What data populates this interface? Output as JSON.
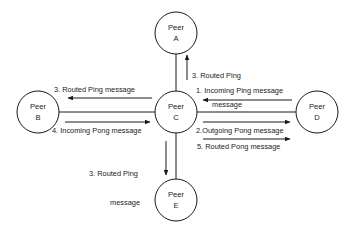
{
  "diagram": {
    "background_color": "#ffffff",
    "stroke_color": "#1a1a1a",
    "nodes": [
      {
        "id": "A",
        "line1": "Peer",
        "line2": "A",
        "cx": 176,
        "cy": 33,
        "r": 21
      },
      {
        "id": "B",
        "line1": "Peer",
        "line2": "B",
        "cx": 38,
        "cy": 112,
        "r": 21
      },
      {
        "id": "C",
        "line1": "Peer",
        "line2": "C",
        "cx": 176,
        "cy": 112,
        "r": 21
      },
      {
        "id": "D",
        "line1": "Peer",
        "line2": "D",
        "cx": 317,
        "cy": 112,
        "r": 21
      },
      {
        "id": "E",
        "line1": "Peer",
        "line2": "E",
        "cx": 176,
        "cy": 200,
        "r": 21
      }
    ],
    "edges": [
      {
        "id": "edge-a-c",
        "from": "A",
        "to": "C"
      },
      {
        "id": "edge-b-c",
        "from": "B",
        "to": "C"
      },
      {
        "id": "edge-c-d",
        "from": "C",
        "to": "D"
      },
      {
        "id": "edge-c-e",
        "from": "C",
        "to": "E"
      }
    ],
    "labels": [
      {
        "id": "label-1-incoming-ping",
        "step": "1.",
        "text": "1. Incoming Ping message",
        "lines": [
          "1. Incoming Ping message"
        ],
        "direction": "right-to-left",
        "edge": "edge-c-d"
      },
      {
        "id": "label-2-outgoing-pong",
        "step": "2.",
        "text": "2.Outgoing Pong message",
        "lines": [
          "2.Outgoing Pong message"
        ],
        "direction": "left-to-right",
        "edge": "edge-c-d"
      },
      {
        "id": "label-3-routed-ping-up",
        "step": "3.",
        "text": "3. Routed Ping message",
        "lines": [
          "3. Routed Ping",
          "message"
        ],
        "direction": "upward",
        "edge": "edge-a-c"
      },
      {
        "id": "label-3-routed-ping-left",
        "step": "3.",
        "text": "3. Routed Ping message",
        "lines": [
          "3. Routed Ping message"
        ],
        "direction": "right-to-left",
        "edge": "edge-b-c"
      },
      {
        "id": "label-3-routed-ping-down",
        "step": "3.",
        "text": "3. Routed Ping message",
        "lines": [
          "3. Routed Ping",
          "message"
        ],
        "direction": "downward",
        "edge": "edge-c-e"
      },
      {
        "id": "label-4-incoming-pong",
        "step": "4.",
        "text": "4. Incoming Pong message",
        "lines": [
          "4. Incoming Pong message"
        ],
        "direction": "left-to-right",
        "edge": "edge-b-c"
      },
      {
        "id": "label-5-routed-pong",
        "step": "5.",
        "text": "5. Routed Pong message",
        "lines": [
          "5. Routed Pong message"
        ],
        "direction": "left-to-right",
        "edge": "edge-c-d"
      }
    ]
  }
}
